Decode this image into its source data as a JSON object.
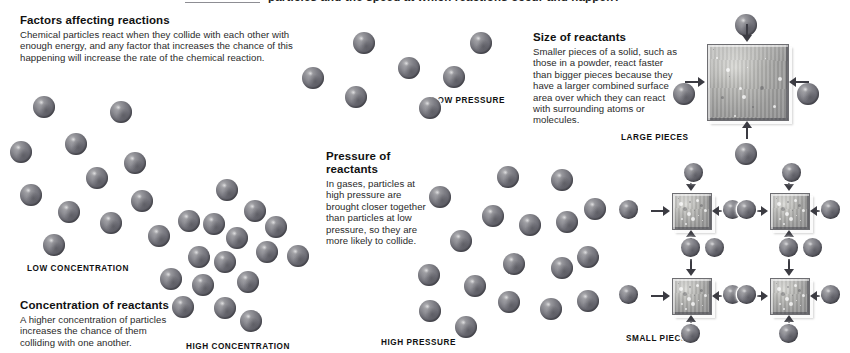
{
  "top_strip": {
    "clipped_headline": "particles   and the speed at which reactions occur and happen?"
  },
  "sections": {
    "factors": {
      "heading": "Factors affecting reactions",
      "body": "Chemical particles react when they collide with each other with enough energy, and any factor that increases the chance of this happening will increase the rate of the chemical reaction."
    },
    "concentration": {
      "heading": "Concentration of reactants",
      "body": "A higher concentration of particles increases the chance of them colliding with one another.",
      "label_low": "LOW CONCENTRATION",
      "label_high": "HIGH CONCENTRATION"
    },
    "pressure": {
      "heading": "Pressure of reactants",
      "body": "In gases, particles at high pressure are brought closer together than particles at low pressure, so they are more likely to collide.",
      "label_low": "LOW PRESSURE",
      "label_high": "HIGH PRESSURE"
    },
    "size": {
      "heading": "Size of reactants",
      "body": "Smaller pieces of a solid, such as those in a powder, react faster than bigger pieces because they have a larger combined surface area over which they can react with surrounding atoms or molecules.",
      "label_large": "LARGE PIECES",
      "label_small": "SMALL PIECES"
    }
  },
  "colors": {
    "particle_dark": "#55555d",
    "particle_light": "#b9b9bc",
    "piece_fill": "#b4b4b1",
    "arrow": "#3b3b42",
    "text": "#1a1a1a"
  },
  "diagram": {
    "particle_diameter_px": 22,
    "low_concentration_particles": [
      {
        "x": 33,
        "y": 96
      },
      {
        "x": 110,
        "y": 101
      },
      {
        "x": 10,
        "y": 141
      },
      {
        "x": 65,
        "y": 133
      },
      {
        "x": 86,
        "y": 167
      },
      {
        "x": 124,
        "y": 152
      },
      {
        "x": 20,
        "y": 184
      },
      {
        "x": 58,
        "y": 201
      },
      {
        "x": 100,
        "y": 212
      },
      {
        "x": 131,
        "y": 190
      },
      {
        "x": 148,
        "y": 225
      },
      {
        "x": 43,
        "y": 234
      }
    ],
    "high_concentration_particles": [
      {
        "x": 216,
        "y": 179
      },
      {
        "x": 244,
        "y": 200
      },
      {
        "x": 203,
        "y": 213
      },
      {
        "x": 265,
        "y": 216
      },
      {
        "x": 226,
        "y": 227
      },
      {
        "x": 178,
        "y": 210
      },
      {
        "x": 256,
        "y": 241
      },
      {
        "x": 214,
        "y": 251
      },
      {
        "x": 287,
        "y": 245
      },
      {
        "x": 188,
        "y": 246
      },
      {
        "x": 237,
        "y": 271
      },
      {
        "x": 192,
        "y": 274
      },
      {
        "x": 160,
        "y": 268
      },
      {
        "x": 214,
        "y": 297
      },
      {
        "x": 240,
        "y": 310
      },
      {
        "x": 172,
        "y": 296
      }
    ],
    "low_pressure_particles": [
      {
        "x": 302,
        "y": 67
      },
      {
        "x": 353,
        "y": 32
      },
      {
        "x": 345,
        "y": 86
      },
      {
        "x": 398,
        "y": 57
      },
      {
        "x": 443,
        "y": 66
      },
      {
        "x": 470,
        "y": 32
      },
      {
        "x": 419,
        "y": 97
      }
    ],
    "high_pressure_particles": [
      {
        "x": 497,
        "y": 166
      },
      {
        "x": 551,
        "y": 169
      },
      {
        "x": 429,
        "y": 186
      },
      {
        "x": 482,
        "y": 205
      },
      {
        "x": 519,
        "y": 214
      },
      {
        "x": 556,
        "y": 211
      },
      {
        "x": 450,
        "y": 230
      },
      {
        "x": 503,
        "y": 253
      },
      {
        "x": 551,
        "y": 257
      },
      {
        "x": 418,
        "y": 264
      },
      {
        "x": 464,
        "y": 275
      },
      {
        "x": 419,
        "y": 300
      },
      {
        "x": 498,
        "y": 291
      },
      {
        "x": 540,
        "y": 298
      },
      {
        "x": 577,
        "y": 290
      },
      {
        "x": 577,
        "y": 246
      },
      {
        "x": 455,
        "y": 316
      },
      {
        "x": 584,
        "y": 198
      }
    ],
    "large_piece": {
      "x": 707,
      "y": 44,
      "w": 80,
      "h": 75
    },
    "large_piece_particles": [
      {
        "x": 735,
        "y": 14
      },
      {
        "x": 673,
        "y": 83
      },
      {
        "x": 797,
        "y": 83
      },
      {
        "x": 735,
        "y": 143
      }
    ],
    "small_pieces": [
      {
        "x": 672,
        "y": 193,
        "w": 38,
        "h": 35
      },
      {
        "x": 770,
        "y": 193,
        "w": 38,
        "h": 35
      },
      {
        "x": 672,
        "y": 278,
        "w": 38,
        "h": 35
      },
      {
        "x": 770,
        "y": 278,
        "w": 38,
        "h": 35
      }
    ],
    "small_piece_particles": [
      {
        "x": 684,
        "y": 163
      },
      {
        "x": 619,
        "y": 200
      },
      {
        "x": 723,
        "y": 200
      },
      {
        "x": 681,
        "y": 238
      },
      {
        "x": 782,
        "y": 163
      },
      {
        "x": 737,
        "y": 200
      },
      {
        "x": 821,
        "y": 200
      },
      {
        "x": 779,
        "y": 238
      },
      {
        "x": 705,
        "y": 238
      },
      {
        "x": 803,
        "y": 238
      },
      {
        "x": 619,
        "y": 285
      },
      {
        "x": 723,
        "y": 285
      },
      {
        "x": 681,
        "y": 324
      },
      {
        "x": 737,
        "y": 285
      },
      {
        "x": 821,
        "y": 285
      },
      {
        "x": 779,
        "y": 324
      }
    ]
  }
}
